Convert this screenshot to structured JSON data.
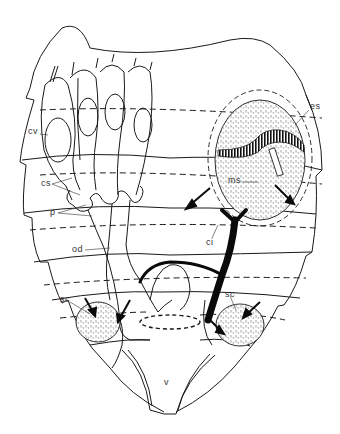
{
  "diagram": {
    "type": "anatomical-line-drawing",
    "labels": [
      {
        "id": "cv",
        "text": "cv",
        "x": 28,
        "y": 131
      },
      {
        "id": "cs",
        "text": "cs",
        "x": 42,
        "y": 181
      },
      {
        "id": "p",
        "text": "p",
        "x": 50,
        "y": 211
      },
      {
        "id": "od",
        "text": "od",
        "x": 73,
        "y": 248
      },
      {
        "id": "sc-left",
        "text": "sc",
        "x": 61,
        "y": 300
      },
      {
        "id": "es",
        "text": "es",
        "x": 311,
        "y": 106
      },
      {
        "id": "ms",
        "text": "ms",
        "x": 230,
        "y": 179
      },
      {
        "id": "ci",
        "text": "ci",
        "x": 207,
        "y": 240
      },
      {
        "id": "sc-right",
        "text": "sc",
        "x": 226,
        "y": 293
      },
      {
        "id": "v",
        "text": "v",
        "x": 164,
        "y": 381
      }
    ],
    "colors": {
      "line": "#1a1a1a",
      "fill_dark": "#0a0a0a",
      "stipple": "#bdbdbd",
      "background": "#ffffff"
    }
  }
}
